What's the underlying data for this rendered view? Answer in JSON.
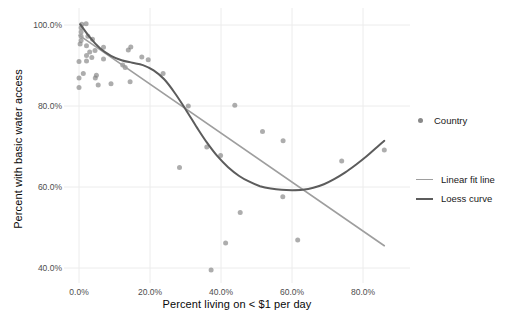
{
  "chart_data": {
    "type": "scatter",
    "title": "",
    "xlabel": "Percent living on < $1 per day",
    "ylabel": "Percent with basic water access",
    "x_ticks": {
      "values": [
        0,
        20,
        40,
        60,
        80
      ],
      "labels": [
        "0.0%",
        "20.0%",
        "40.0%",
        "60.0%",
        "80.0%"
      ]
    },
    "y_ticks": {
      "values": [
        40,
        60,
        80,
        100
      ],
      "labels": [
        "40.0%",
        "60.0%",
        "80.0%",
        "100.0%"
      ]
    },
    "xlim": [
      -4,
      93
    ],
    "ylim": [
      36,
      104
    ],
    "grid": "major gridlines only, very light gray on white, no axis lines",
    "legend_position": "right",
    "colors": {
      "point": "#7b7b7b",
      "linear_fit": "#9e9e9e",
      "loess": "#5c5c5c",
      "gridline": "#ececec",
      "tick_label": "#4d4d4d"
    },
    "series": [
      {
        "name": "Country",
        "type": "scatter",
        "points": [
          [
            0.8,
            100.2
          ],
          [
            2.0,
            100.3
          ],
          [
            0.6,
            99.3
          ],
          [
            0.6,
            98.3
          ],
          [
            0.6,
            97.2
          ],
          [
            0.6,
            96.2
          ],
          [
            0.3,
            95.3
          ],
          [
            2.5,
            97.2
          ],
          [
            3.8,
            96.5
          ],
          [
            2.1,
            94.9
          ],
          [
            3.0,
            93.3
          ],
          [
            4.5,
            93.7
          ],
          [
            6.9,
            94.5
          ],
          [
            2.1,
            92.5
          ],
          [
            3.6,
            92.0
          ],
          [
            2.1,
            91.1
          ],
          [
            6.9,
            91.6
          ],
          [
            0.0,
            91.0
          ],
          [
            1.2,
            88.0
          ],
          [
            4.9,
            87.6
          ],
          [
            0.0,
            86.9
          ],
          [
            4.6,
            86.9
          ],
          [
            0.0,
            84.6
          ],
          [
            5.4,
            85.2
          ],
          [
            9.0,
            85.5
          ],
          [
            12.3,
            90.1
          ],
          [
            13.9,
            93.8
          ],
          [
            14.6,
            94.6
          ],
          [
            17.7,
            92.1
          ],
          [
            19.5,
            91.4
          ],
          [
            13.0,
            89.5
          ],
          [
            23.7,
            88.0
          ],
          [
            14.4,
            86.0
          ],
          [
            30.8,
            80.0
          ],
          [
            43.9,
            80.2
          ],
          [
            28.3,
            64.8
          ],
          [
            36.0,
            69.9
          ],
          [
            39.9,
            67.8
          ],
          [
            51.7,
            73.7
          ],
          [
            57.5,
            71.4
          ],
          [
            45.4,
            53.7
          ],
          [
            41.3,
            46.2
          ],
          [
            61.6,
            46.9
          ],
          [
            37.2,
            39.5
          ],
          [
            57.4,
            57.6
          ],
          [
            74.0,
            66.4
          ],
          [
            86.0,
            69.1
          ]
        ]
      },
      {
        "name": "Linear fit line",
        "type": "line",
        "points": [
          [
            0,
            97.5
          ],
          [
            86,
            45.5
          ]
        ]
      },
      {
        "name": "Loess curve",
        "type": "line",
        "points": [
          [
            0.3,
            100.2
          ],
          [
            3,
            97.0
          ],
          [
            6,
            94.2
          ],
          [
            9,
            92.4
          ],
          [
            12,
            91.3
          ],
          [
            15,
            90.7
          ],
          [
            18,
            90.1
          ],
          [
            21,
            88.8
          ],
          [
            24,
            86.6
          ],
          [
            27,
            83.2
          ],
          [
            30,
            79.2
          ],
          [
            33,
            75.0
          ],
          [
            36,
            71.0
          ],
          [
            39,
            67.6
          ],
          [
            42,
            64.9
          ],
          [
            45,
            62.8
          ],
          [
            48,
            61.3
          ],
          [
            51,
            60.2
          ],
          [
            54,
            59.6
          ],
          [
            57,
            59.3
          ],
          [
            60,
            59.2
          ],
          [
            63,
            59.3
          ],
          [
            66,
            59.8
          ],
          [
            69,
            60.7
          ],
          [
            72,
            62.0
          ],
          [
            75,
            63.6
          ],
          [
            78,
            65.5
          ],
          [
            81,
            67.6
          ],
          [
            84,
            69.9
          ],
          [
            86,
            71.4
          ]
        ]
      }
    ]
  }
}
